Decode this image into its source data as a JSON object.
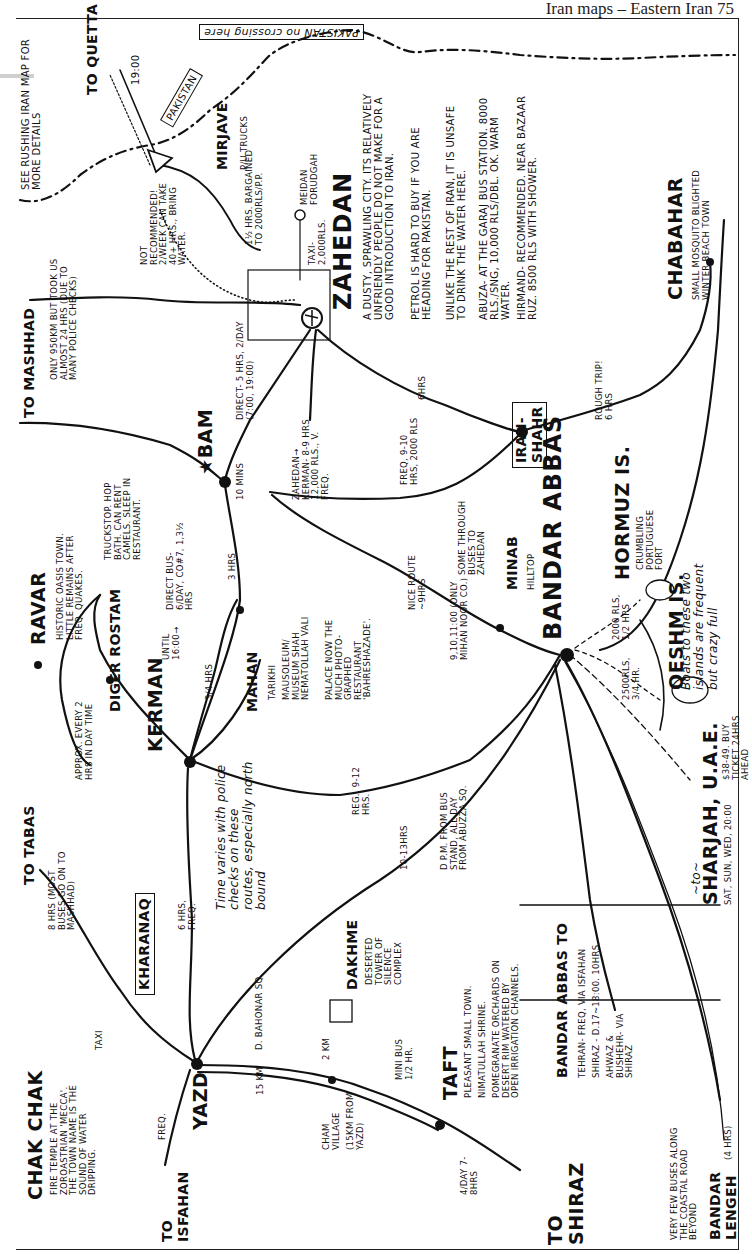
{
  "page_header": "Iran maps – Eastern Iran 75",
  "map": {
    "title": "Eastern Iran",
    "border_label": {
      "country": "PAKISTAN",
      "note": "no crossing here"
    },
    "see_note": "SEE RUSHING IRAN MAP FOR MORE DETAILS",
    "places": {
      "quetta": {
        "name": "TO QUETTA",
        "time": "19:00"
      },
      "pakistan_box": "PAKISTAN",
      "mirjave": {
        "name": "MIRJAVE",
        "note": "P/U TRUCKS",
        "cost": "1½ HRS. BARGAINED TO 2000RLS/P.P."
      },
      "meidan": {
        "name": "MEIDAN FORUDGAH",
        "taxi": "TAXI- 2,000RLS."
      },
      "train_note": "NOT RECOMMENDED! 2/WEEK CAN TAKE 40+ HRS., BRING WATER.",
      "zahedan": {
        "name": "ZAHEDAN",
        "desc": [
          "A DUSTY, SPRAWLING CITY. ITS RELATIVELY UNFRIENDLY PEOPLE DO NOT MAKE FOR A GOOD INTRODUCTION TO IRAN.",
          "PETROL IS HARD TO BUY IF YOU ARE HEADING FOR PAKISTAN.",
          "UNLIKE THE REST OF IRAN, IT IS UNSAFE TO DRINK THE WATER HERE.",
          "ABUZA- AT THE GARAJ BUS STATION. 8000 RLS./SNG, 10,000 RLS/DBL. OK. WARM WATER.",
          "HIRMAND- RECOMMENDED. NEAR BAZAAR RUZ. 8500 RLS WITH SHOWER."
        ]
      },
      "mashhad": {
        "name": "TO MASHHAD",
        "note": "ONLY 950KM BUT TOOK US ALMOST 24 HRS (DUE TO MANY POLICE CHECKS)"
      },
      "bam": {
        "name": "BAM",
        "direct": "DIRECT- 5 HRS, 2/DAY (7:00, 19:00)",
        "mins": "10 MINS",
        "truckstop": "TRUCKSTOP. HOP BATH. CAN RENT CAMELS. SLEEP IN RESTAURANT."
      },
      "zahedan_kerman": "ZAHEDAN→ KERMAN- 8-9 HRS 12,000 RLS., V. FREQ.",
      "iranshahr": {
        "name": "IRAN- SHAHR",
        "from_zahedan": "6HRS",
        "from_bandar": "FREQ, 9-10 HRS, 2000 RLS",
        "to_chabahar": "ROUGH TRIP! 6 HRS"
      },
      "chabahar": {
        "name": "CHABAHAR",
        "desc": "SMALL MOSQUITO BLIGHTED WINTER BEACH TOWN"
      },
      "ravar": {
        "name": "RAVAR",
        "desc": "HISTORIC OASIS TOWN. LITTLE REMAINS AFTER FREQ. QUAKES."
      },
      "diger_rostam": {
        "name": "DIGER ROSTAM"
      },
      "kerman": {
        "name": "KERMAN",
        "until": "UNTIL 16:00→",
        "direct_bus": "DIRECT BUS- 6/DAY, CO#7, 1,3½ HRS",
        "to_mahan": "3/4 HRS",
        "mahan_bam": "3 HRS",
        "approx": "APPROX. EVERY 2 HRS IN DAY TIME"
      },
      "mahan": {
        "name": "MAHAN",
        "items": [
          "TARIKHI",
          "MAUSOLEUM/ MUSEUM SHAH NEMATOLLAH VALI",
          "PALACE NOW THE MUCH PHOTO- GRAPHED RESTAURANT 'BAHRESHAZADE'."
        ]
      },
      "bandar_abbas": {
        "name": "BANDAR ABBAS",
        "nice_route": "NICE ROUTE ~9HRS",
        "times": "9,10,11:00 (ONLY MIHAN NOOR CO.)",
        "through": "SOME THROUGH BUSES TO ZAHEDAN",
        "reg": "REG., 9-12 HRS.",
        "from_yazd": "10-13HRS",
        "pm": "d P.M. FROM BUS STAND, ALL DAY FROM ABUZZA SQ."
      },
      "minab": {
        "name": "MINAB",
        "note": "HILLTOP"
      },
      "hormuz": {
        "name": "HORMUZ IS.",
        "desc": "CRUMBLING PORTUGUESE FORT",
        "ferry": "2000 RLS, 1/2 HRS"
      },
      "qeshm": {
        "name": "QESHM IS.",
        "ferry": "2500RLS, 3/4 HR."
      },
      "boats_note": "Boats to these two islands are frequent but crazy full",
      "sharjah": {
        "name": "SHARJAH, U.A.E.",
        "prefix": "~to~",
        "price": "$38-49. BUY TICKET 24hrs AHEAD",
        "days": "SAT, SUN, WED, 20:00"
      },
      "tabas": {
        "name": "TO TABAS",
        "note": "8 HRS (MOST BUSES GO ON TO MASHHAD)"
      },
      "kharanaq": {
        "name": "KHARANAQ",
        "to_kerman": "6 HRS, FREQ."
      },
      "police_note": "Time varies with police checks on these routes, especially north bound",
      "chak_chak": {
        "name": "CHAK CHAK",
        "desc": "FIRE TEMPLE AT THE ZOROASTRIAN 'MECCA'. THE TOWN NAME IS THE SOUND OF WATER DRIPPING.",
        "taxi": "TAXI"
      },
      "yazd": {
        "name": "YAZD",
        "to_isfahan": "FREQ.",
        "isfahan": "TO ISFAHAN",
        "km": "15 KM",
        "bahonar": "d. BAHONAR SQ."
      },
      "dakhme": {
        "name": "DAKHME",
        "desc": "DESERTED TOWER OF SILENCE COMPLEX",
        "walk": "2 KM"
      },
      "cham": {
        "name": "CHAM VILLAGE",
        "desc": "(15KM FROM YAZD)"
      },
      "taft": {
        "name": "TAFT",
        "minibus": "MINI BUS 1/2 HR.",
        "desc": [
          "PLEASANT SMALL TOWN.",
          "NIMATULLAH SHRINE.",
          "POMEGRANATE ORCHARDS ON DESERT RIM WATERED BY OPEN IRRIGATION CHANNELS."
        ]
      },
      "shiraz": {
        "name": "TO SHIRAZ",
        "freq": "4/DAY 7-8HRS"
      },
      "bandar_box": {
        "title": "BANDAR ABBAS TO",
        "lines": [
          "TEHRAN- FREQ, VIA ISFAHAN",
          "SHIRAZ - d.17~18:00. 10HRS.",
          "AHWAZ & BUSHEHR- VIA SHIRAZ"
        ]
      },
      "coastal": {
        "text": "VERY FEW BUSES ALONG THE COASTAL ROAD BEYOND",
        "town": "BANDAR LENGEH",
        "hrs": "(4 HRS)"
      }
    },
    "colors": {
      "ink": "#111111",
      "paper": "#ffffff",
      "dots": "#888888"
    }
  }
}
